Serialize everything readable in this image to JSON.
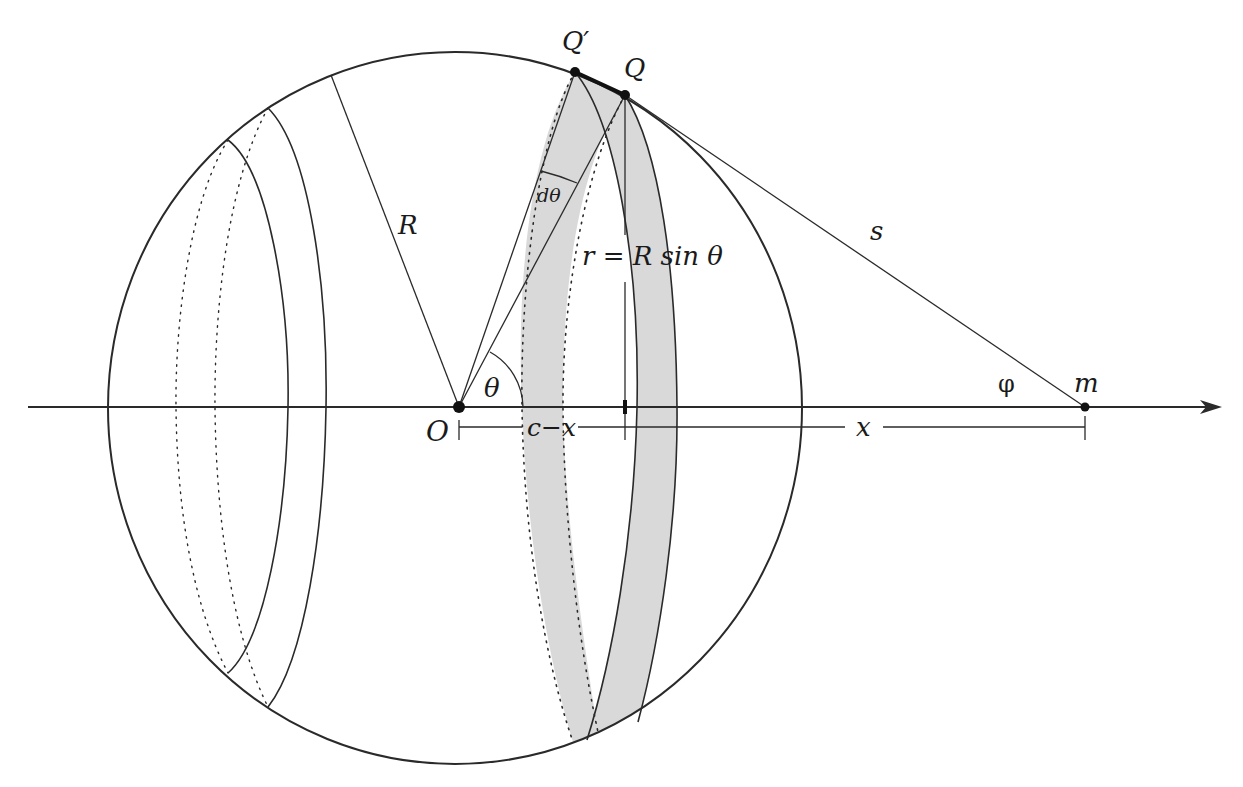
{
  "figure": {
    "colors": {
      "line": "#2a2a2a",
      "band_fill": "#d9d9d9",
      "background": "#ffffff"
    },
    "labels": {
      "q_prime": "Q′",
      "q": "Q",
      "d_theta": "dθ",
      "radius": "R",
      "ring_radius": "r = R sin θ",
      "distance_s": "s",
      "theta": "θ",
      "phi": "φ",
      "mass": "m",
      "origin": "O",
      "c_minus_x": "c−x",
      "x": "x"
    }
  }
}
